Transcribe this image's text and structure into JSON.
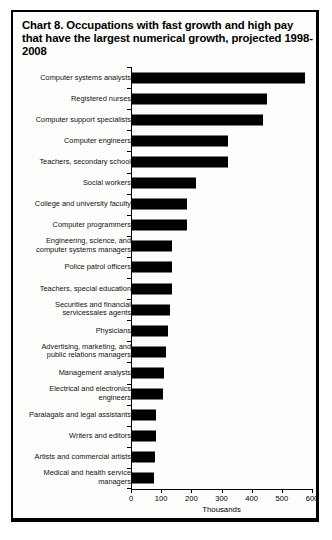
{
  "chart_data": {
    "type": "bar",
    "orientation": "horizontal",
    "title": "Chart 8.  Occupations with fast growth and high pay that have the largest numerical growth, projected 1998-2008",
    "title_label": "Chart 8.",
    "title_text": "Occupations with fast growth and high pay that have the largest numerical growth, projected 1998-2008",
    "xlabel": "Thousands",
    "ylabel": "",
    "xlim": [
      0,
      600
    ],
    "xticks": [
      0,
      100,
      200,
      300,
      400,
      500,
      600
    ],
    "xtick_labels": [
      "0",
      "100",
      "200",
      "300",
      "400",
      "500",
      "600"
    ],
    "grid": false,
    "legend": false,
    "bar_color": "#000000",
    "categories": [
      "Computer systems analysts",
      "Registered nurses",
      "Computer support specialists",
      "Computer engineers",
      "Teachers, secondary school",
      "Social workers",
      "College and university faculty",
      "Computer programmers",
      "Engineering, science, and\ncomputer systems managers",
      "Police patrol officers",
      "Teachers, special education",
      "Securities and financial\nservicessales agents",
      "Physicians",
      "Advertising, marketing, and\npublic relations managers",
      "Management analysts",
      "Electrical and electronics\nengineers",
      "Paralagals and legal assistants",
      "Writers and editors",
      "Artists and commercial artists",
      "Medical and health service\nmanagers"
    ],
    "values": [
      577,
      451,
      439,
      323,
      322,
      217,
      184,
      185,
      136,
      136,
      135,
      128,
      124,
      117,
      110,
      106,
      84,
      83,
      78,
      77
    ]
  }
}
